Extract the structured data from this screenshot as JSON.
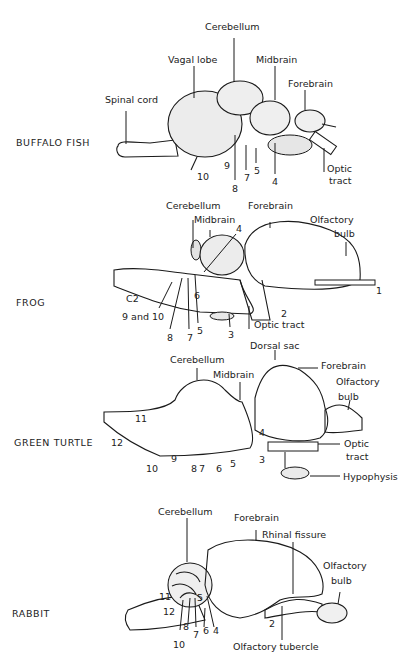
{
  "figure": {
    "panels": [
      {
        "species": "BUFFALO FISH",
        "labels": {
          "cerebellum": "Cerebellum",
          "vagal_lobe": "Vagal lobe",
          "midbrain": "Midbrain",
          "forebrain": "Forebrain",
          "spinal_cord": "Spinal cord",
          "optic_tract_1": "Optic",
          "optic_tract_2": "tract"
        },
        "nerves": [
          "10",
          "9",
          "8",
          "7",
          "5",
          "4"
        ]
      },
      {
        "species": "FROG",
        "labels": {
          "cerebellum": "Cerebellum",
          "forebrain": "Forebrain",
          "midbrain": "Midbrain",
          "olfactory_bulb_1": "Olfactory",
          "olfactory_bulb_2": "bulb",
          "c2": "C2",
          "nerve_9_10": "9 and 10",
          "optic_tract": "Optic tract"
        },
        "nerves": [
          "4",
          "1",
          "6",
          "2",
          "8",
          "7",
          "5",
          "3"
        ]
      },
      {
        "species": "GREEN TURTLE",
        "labels": {
          "dorsal_sac": "Dorsal sac",
          "cerebellum": "Cerebellum",
          "midbrain": "Midbrain",
          "forebrain": "Forebrain",
          "olfactory_bulb_1": "Olfactory",
          "olfactory_bulb_2": "bulb",
          "optic_tract_1": "Optic",
          "optic_tract_2": "tract",
          "hypophysis": "Hypophysis"
        },
        "nerves": [
          "11",
          "12",
          "10",
          "9",
          "8",
          "7",
          "6",
          "5",
          "4",
          "3"
        ]
      },
      {
        "species": "RABBIT",
        "labels": {
          "cerebellum": "Cerebellum",
          "forebrain": "Forebrain",
          "rhinal_fissure": "Rhinal fissure",
          "olfactory_bulb_1": "Olfactory",
          "olfactory_bulb_2": "bulb",
          "olfactory_tubercle": "Olfactory tubercle"
        },
        "nerves": [
          "11",
          "12",
          "5",
          "8",
          "7",
          "6",
          "4",
          "10",
          "2"
        ]
      }
    ]
  }
}
